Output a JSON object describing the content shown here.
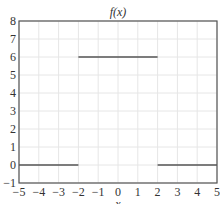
{
  "chart_data": {
    "type": "line",
    "title": "f(x)",
    "xlabel": "x",
    "ylabel": "",
    "xlim": [
      -5,
      5
    ],
    "ylim": [
      -1,
      8
    ],
    "grid": true,
    "x_ticks": [
      -5,
      -4,
      -3,
      -2,
      -1,
      0,
      1,
      2,
      3,
      4,
      5
    ],
    "y_ticks": [
      -1,
      0,
      1,
      2,
      3,
      4,
      5,
      6,
      7,
      8
    ],
    "x_tick_labels": [
      "−5",
      "−4",
      "−3",
      "−2",
      "−1",
      "0",
      "1",
      "2",
      "3",
      "4",
      "5"
    ],
    "y_tick_labels": [
      "−1",
      "0",
      "1",
      "2",
      "3",
      "4",
      "5",
      "6",
      "7",
      "8"
    ],
    "series": [
      {
        "name": "f(x)",
        "color": "#555555",
        "segments": [
          {
            "x": [
              -5,
              -2
            ],
            "y": [
              0,
              0
            ]
          },
          {
            "x": [
              -2,
              2
            ],
            "y": [
              6,
              6
            ]
          },
          {
            "x": [
              2,
              5
            ],
            "y": [
              0,
              0
            ]
          }
        ]
      }
    ],
    "legend": null
  },
  "colors": {
    "line": "#555555",
    "axes": "#555555",
    "grid": "#e6e6e6"
  }
}
